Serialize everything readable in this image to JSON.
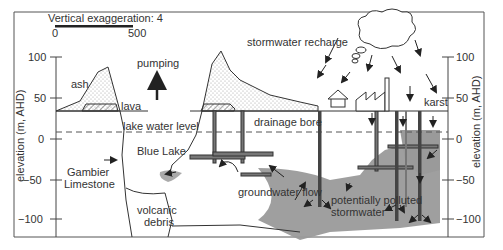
{
  "scale_bar": {
    "title": "Vertical exaggeration: 4",
    "min": "0",
    "max": "500"
  },
  "axes": {
    "left": {
      "label": "elevation  (m, AHD)",
      "ticks": [
        "100",
        "50",
        "0",
        "−50",
        "−100"
      ]
    },
    "right": {
      "label": "elevation  (m, AHD)",
      "ticks": [
        "100",
        "50",
        "0",
        "−50",
        "−100"
      ]
    }
  },
  "labels": {
    "ash": "ash",
    "lava": "lava",
    "pumping": "pumping",
    "lake_water_level": "lake water level",
    "blue_lake": "Blue Lake",
    "gambier_1": "Gambier",
    "gambier_2": "Limestone",
    "volcanic_1": "volcanic",
    "volcanic_2": "debris",
    "groundwater_flow": "groundwater flow",
    "drainage_bore": "drainage bore",
    "stormwater_recharge": "stormwater recharge",
    "karst": "karst",
    "polluted_1": "potentially polluted",
    "polluted_2": "stormwater"
  },
  "colors": {
    "line": "#333333",
    "plume": "#9a9a9a",
    "stipple": "#bdbdbd"
  }
}
